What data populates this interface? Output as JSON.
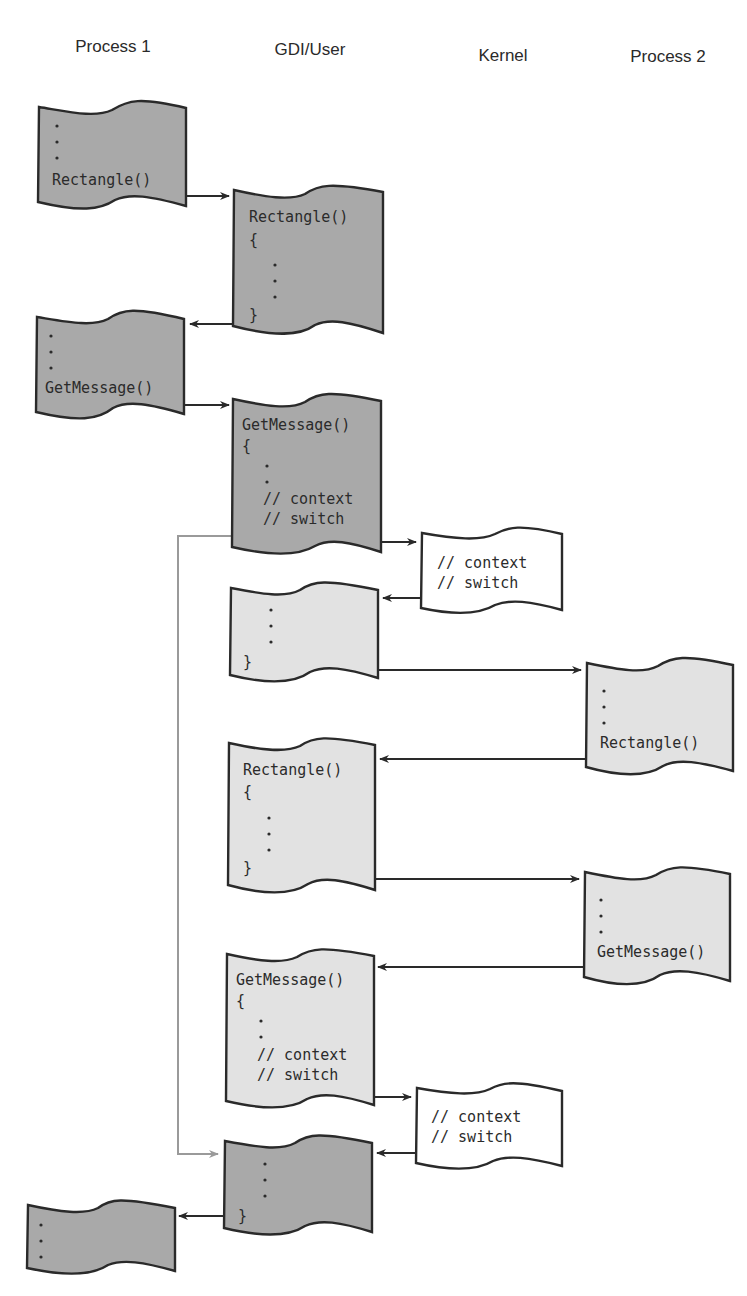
{
  "diagram": {
    "columns": [
      {
        "id": "process1",
        "label": "Process 1"
      },
      {
        "id": "gdi_user",
        "label": "GDI/User"
      },
      {
        "id": "kernel",
        "label": "Kernel"
      },
      {
        "id": "process2",
        "label": "Process 2"
      }
    ],
    "colors": {
      "process1_active": "#a9a9a9",
      "process2_active": "#e2e2e2",
      "kernel": "#ffffff",
      "outline": "#2a2a2a",
      "gray_connector": "#9a9a9a"
    },
    "nodes": [
      {
        "id": "p1_call_rect",
        "column": "process1",
        "shade": "dark",
        "lines": [
          "Rectangle()"
        ],
        "leading_dots": 3
      },
      {
        "id": "gdi_rect_1",
        "column": "gdi_user",
        "shade": "dark",
        "lines": [
          "Rectangle()",
          "{",
          "}"
        ],
        "inner_dots": 3
      },
      {
        "id": "p1_call_getmsg",
        "column": "process1",
        "shade": "dark",
        "lines": [
          "GetMessage()"
        ],
        "leading_dots": 2
      },
      {
        "id": "gdi_getmsg_1",
        "column": "gdi_user",
        "shade": "dark",
        "lines": [
          "GetMessage()",
          "{",
          "// context",
          "// switch"
        ],
        "inner_dots": 2
      },
      {
        "id": "kernel_switch_1",
        "column": "kernel",
        "shade": "white",
        "lines": [
          "// context",
          "// switch"
        ]
      },
      {
        "id": "gdi_return_p2",
        "column": "gdi_user",
        "shade": "light",
        "lines": [
          "}"
        ],
        "inner_dots": 3
      },
      {
        "id": "p2_call_rect",
        "column": "process2",
        "shade": "light",
        "lines": [
          "Rectangle()"
        ],
        "leading_dots": 3
      },
      {
        "id": "gdi_rect_2",
        "column": "gdi_user",
        "shade": "light",
        "lines": [
          "Rectangle()",
          "{",
          "}"
        ],
        "inner_dots": 3
      },
      {
        "id": "p2_call_getmsg",
        "column": "process2",
        "shade": "light",
        "lines": [
          "GetMessage()"
        ],
        "leading_dots": 3
      },
      {
        "id": "gdi_getmsg_2",
        "column": "gdi_user",
        "shade": "light",
        "lines": [
          "GetMessage()",
          "{",
          "// context",
          "// switch"
        ],
        "inner_dots": 2
      },
      {
        "id": "kernel_switch_2",
        "column": "kernel",
        "shade": "white",
        "lines": [
          "// context",
          "// switch"
        ]
      },
      {
        "id": "gdi_return_p1",
        "column": "gdi_user",
        "shade": "dark",
        "lines": [
          "}"
        ],
        "inner_dots": 3
      },
      {
        "id": "p1_resume",
        "column": "process1",
        "shade": "dark",
        "lines": [],
        "leading_dots": 3
      }
    ],
    "edges": [
      {
        "from": "p1_call_rect",
        "to": "gdi_rect_1"
      },
      {
        "from": "gdi_rect_1",
        "to": "p1_call_getmsg"
      },
      {
        "from": "p1_call_getmsg",
        "to": "gdi_getmsg_1"
      },
      {
        "from": "gdi_getmsg_1",
        "to": "kernel_switch_1"
      },
      {
        "from": "kernel_switch_1",
        "to": "gdi_return_p2"
      },
      {
        "from": "gdi_return_p2",
        "to": "p2_call_rect"
      },
      {
        "from": "p2_call_rect",
        "to": "gdi_rect_2"
      },
      {
        "from": "gdi_rect_2",
        "to": "p2_call_getmsg"
      },
      {
        "from": "p2_call_getmsg",
        "to": "gdi_getmsg_2"
      },
      {
        "from": "gdi_getmsg_2",
        "to": "kernel_switch_2"
      },
      {
        "from": "kernel_switch_2",
        "to": "gdi_return_p1"
      },
      {
        "from": "gdi_getmsg_1",
        "to": "gdi_return_p1",
        "style": "gray"
      },
      {
        "from": "gdi_return_p1",
        "to": "p1_resume"
      }
    ],
    "text": {
      "rect": "Rectangle()",
      "getmsg": "GetMessage()",
      "open_brace": "{",
      "close_brace": "}",
      "ctx": "// context",
      "sw": "// switch"
    }
  }
}
